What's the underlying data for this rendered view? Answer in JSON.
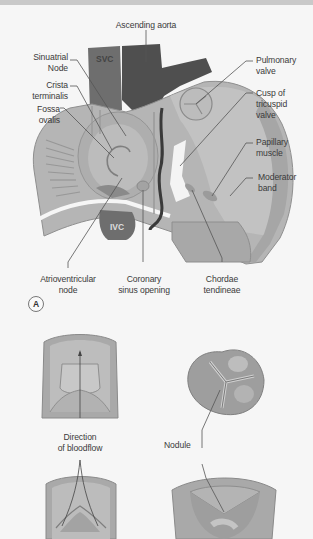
{
  "panel_a": {
    "badge": "A",
    "labels": {
      "ascending_aorta": "Ascending aorta",
      "sinuatrial_node": "Sinuatrial\nNode",
      "crista_terminalis": "Crista\nterminalis",
      "fossa_ovalis": "Fossa\novalis",
      "svc": "SVC",
      "ivc": "IVC",
      "pulmonary_valve": "Pulmonary\nvalve",
      "cusp_tricuspid": "Cusp of\ntricuspid\nvalve",
      "papillary_muscle": "Papillary\nmuscle",
      "moderator_band": "Moderator\nband",
      "av_node": "Atrioventricular\nnode",
      "coronary_sinus": "Coronary\nsinus opening",
      "chordae": "Chordae\ntendineae"
    }
  },
  "panel_b": {
    "labels": {
      "direction": "Direction\nof bloodflow",
      "nodule": "Nodule"
    }
  },
  "colors": {
    "tissue_light": "#b8b8b8",
    "tissue_mid": "#a2a2a2",
    "tissue_dark": "#8c8c8c",
    "vessel_dark": "#5e5e5e",
    "leader": "#555555",
    "background": "#f6f6f6"
  }
}
